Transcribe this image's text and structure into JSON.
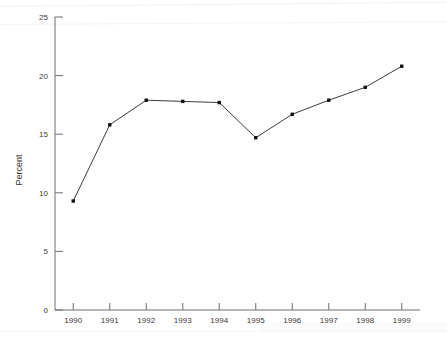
{
  "chart_data": {
    "type": "line",
    "title": "",
    "subtitle": "",
    "xlabel": "",
    "ylabel": "Percent",
    "categories": [
      "1990",
      "1991",
      "1992",
      "1993",
      "1994",
      "1995",
      "1996",
      "1997",
      "1998",
      "1999"
    ],
    "x": [
      1990,
      1991,
      1992,
      1993,
      1994,
      1995,
      1996,
      1997,
      1998,
      1999
    ],
    "values": [
      9.3,
      15.8,
      17.9,
      17.8,
      17.7,
      14.7,
      16.7,
      17.9,
      19.0,
      20.8
    ],
    "series": [
      {
        "name": "Percent",
        "values": [
          9.3,
          15.8,
          17.9,
          17.8,
          17.7,
          14.7,
          16.7,
          17.9,
          19.0,
          20.8
        ]
      }
    ],
    "ylim": [
      0,
      25
    ],
    "xlim": [
      1989.5,
      1999.5
    ],
    "yticks": [
      0,
      5,
      10,
      15,
      20,
      25
    ],
    "ytick_labels": [
      "0",
      "5",
      "10",
      "15",
      "20",
      "25"
    ],
    "xticks": [
      1990,
      1991,
      1992,
      1993,
      1994,
      1995,
      1996,
      1997,
      1998,
      1999
    ],
    "xtick_labels": [
      "1990",
      "1991",
      "1992",
      "1993",
      "1994",
      "1995",
      "1996",
      "1997",
      "1998",
      "1999"
    ],
    "grid": false,
    "legend": false,
    "legend_position": "none",
    "marker": "square",
    "line_color": "#3b3b3b",
    "marker_color": "#111111",
    "axis_color": "#6e6e6e",
    "background_color": "#ffffff",
    "annotations": []
  },
  "axes": {
    "y_title": "Percent",
    "x_title": ""
  }
}
